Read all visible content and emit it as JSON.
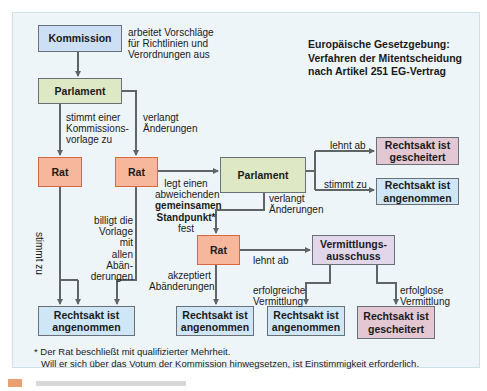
{
  "title": {
    "line1": "Europäische Gesetzgebung:",
    "line2": "Verfahren der Mitentscheidung",
    "line3": "nach Artikel 251 EG-Vertrag"
  },
  "boxes": {
    "kommission": "Kommission",
    "parlament1": "Parlament",
    "rat1": "Rat",
    "rat2": "Rat",
    "parlament2": "Parlament",
    "gescheitert_top": "Rechtsakt ist gescheitert",
    "angenommen_right": "Rechtsakt ist angenommen",
    "rat3": "Rat",
    "vermittlung": "Vermittlungs-ausschuss",
    "angenommen_b1": "Rechtsakt ist angenommen",
    "angenommen_b2": "Rechtsakt ist angenommen",
    "angenommen_b3": "Rechtsakt ist angenommen",
    "gescheitert_b4": "Rechtsakt ist gescheitert"
  },
  "labels": {
    "kommission_note": [
      "arbeitet Vorschläge",
      "für Richtlinien und",
      "Verordnungen aus"
    ],
    "stimmt_einer": [
      "stimmt einer",
      "Kommissions-",
      "vorlage zu"
    ],
    "verlangt1": [
      "verlangt",
      "Änderungen"
    ],
    "stimmt_zu_vertical": "stimmt zu",
    "billigt": [
      "billigt die",
      "Vorlage mit",
      "allen Abän-",
      "derungen"
    ],
    "legt_einen": [
      "legt einen",
      "abweichenden"
    ],
    "gemeinsamen": [
      "gemeinsamen",
      "Standpunkt*"
    ],
    "fest": "fest",
    "lehnt_ab1": "lehnt ab",
    "stimmt_zu2": "stimmt zu",
    "verlangt2": [
      "verlangt",
      "Änderungen"
    ],
    "akzeptiert": [
      "akzeptiert",
      "Abänderungen"
    ],
    "lehnt_ab2": "lehnt ab",
    "erfolgreiche": [
      "erfolgreiche",
      "Vermittlung"
    ],
    "erfolglose": [
      "erfolglose",
      "Vermittlung"
    ]
  },
  "footnote": {
    "line1": "* Der Rat beschließt mit qualifizierter Mehrheit.",
    "line2": "Will er sich über das Votum der Kommission hinwegsetzen, ist Einstimmigkeit erforderlich."
  },
  "colors": {
    "panel": "#eef5f8",
    "blue_box": "#cfe6f7",
    "green_box": "#dfe8c4",
    "orange_box": "#f7b79c",
    "pink_box": "#e3c7d2",
    "lilac_box": "#e2d7ea",
    "line": "#5f6468"
  }
}
